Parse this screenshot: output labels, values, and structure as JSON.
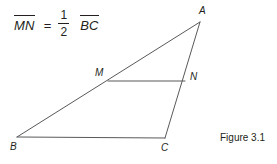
{
  "equation": {
    "left_term": "MN",
    "equals": "=",
    "fraction_numerator": "1",
    "fraction_denominator": "2",
    "right_term": "BC"
  },
  "figure": {
    "caption": "Figure 3.1",
    "line_color": "#58595b",
    "text_color": "#231f20",
    "background": "#ffffff",
    "vertices": {
      "A": {
        "label": "A",
        "x": 200,
        "y": 22
      },
      "B": {
        "label": "B",
        "x": 17,
        "y": 137
      },
      "C": {
        "label": "C",
        "x": 165,
        "y": 138
      },
      "M": {
        "label": "M",
        "x": 108,
        "y": 81
      },
      "N": {
        "label": "N",
        "x": 185,
        "y": 81
      }
    },
    "segments": [
      {
        "name": "AB",
        "from": "A",
        "to": "B"
      },
      {
        "name": "BC",
        "from": "B",
        "to": "C"
      },
      {
        "name": "AC",
        "from": "A",
        "to": "C"
      },
      {
        "name": "MN",
        "from": "M",
        "to": "N"
      }
    ]
  }
}
